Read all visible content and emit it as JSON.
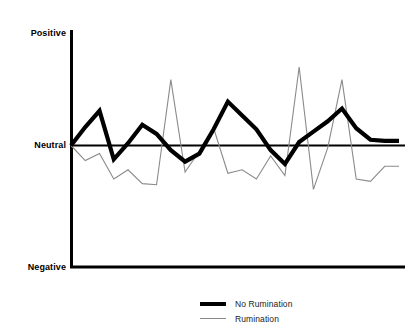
{
  "figure": {
    "background": "#ffffff",
    "width": 412,
    "height": 335
  },
  "axes": {
    "y_tick_labels": {
      "positive": "Positive",
      "neutral": "Neutral",
      "negative": "Negative"
    },
    "x_label": "",
    "y_label": "",
    "title": ""
  },
  "legend": {
    "position": "bottom-center",
    "entries": [
      {
        "label": "No Rumination",
        "color": "#000000",
        "line_width": 4
      },
      {
        "label": "Rumination",
        "color": "#8a8a8a",
        "line_width": 1
      }
    ]
  },
  "chart_data": {
    "type": "line",
    "title": "",
    "xlabel": "",
    "ylabel": "",
    "grid": false,
    "legend_position": "bottom-center",
    "ytick_labels": [
      "Negative",
      "Neutral",
      "Positive"
    ],
    "ytick_values": [
      -1,
      0,
      1
    ],
    "ylim": [
      -1,
      1
    ],
    "xlim": [
      0,
      23
    ],
    "reference_line": {
      "y": 0,
      "label": "Neutral",
      "color": "#000000",
      "width": 2
    },
    "x": [
      0,
      1,
      2,
      3,
      4,
      5,
      6,
      7,
      8,
      9,
      10,
      11,
      12,
      13,
      14,
      15,
      16,
      17,
      18,
      19,
      20,
      21,
      22,
      23
    ],
    "series": [
      {
        "name": "No Rumination",
        "color": "#000000",
        "line_width": 4,
        "values": [
          0.0,
          0.16,
          0.3,
          -0.12,
          0.02,
          0.18,
          0.1,
          -0.04,
          -0.14,
          -0.07,
          0.14,
          0.38,
          0.26,
          0.14,
          -0.04,
          -0.16,
          0.03,
          0.12,
          0.21,
          0.32,
          0.15,
          0.05,
          0.04,
          0.04
        ]
      },
      {
        "name": "Rumination",
        "color": "#8a8a8a",
        "line_width": 1,
        "values": [
          0.0,
          -0.13,
          -0.07,
          -0.29,
          -0.21,
          -0.33,
          -0.34,
          0.57,
          -0.23,
          -0.05,
          0.15,
          -0.24,
          -0.21,
          -0.29,
          -0.09,
          -0.26,
          0.68,
          -0.38,
          -0.02,
          0.57,
          -0.29,
          -0.31,
          -0.18,
          -0.18
        ]
      }
    ]
  }
}
